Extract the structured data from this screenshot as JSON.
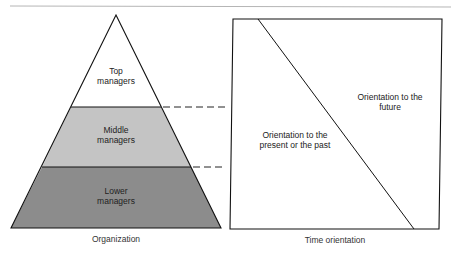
{
  "organization": {
    "caption": "Organization",
    "levels": [
      {
        "label": "Top\nmanagers",
        "color": "#ffffff"
      },
      {
        "label": "Middle\nmanagers",
        "color": "#c4c4c4"
      },
      {
        "label": "Lower\nmanagers",
        "color": "#8c8c8c"
      }
    ]
  },
  "time_orientation": {
    "caption": "Time orientation",
    "future_label": "Orientation to the\nfuture",
    "past_label": "Orientation to the\npresent or the past"
  }
}
